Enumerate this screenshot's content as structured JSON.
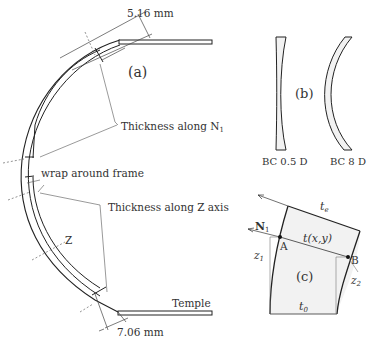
{
  "panel_a": {
    "label": "(a)",
    "dim_top": "5.16 mm",
    "dim_bottom": "7.06 mm",
    "callout_n1": "Thickness along N",
    "callout_n1_sub": "1",
    "callout_wrap": "wrap around frame",
    "callout_z": "Thickness along Z axis",
    "axis_z": "Z",
    "temple": "Temple"
  },
  "panel_b": {
    "label": "(b)",
    "lens_left": "BC 0.5 D",
    "lens_right": "BC 8 D"
  },
  "panel_c": {
    "label": "(c)",
    "t_e": "t",
    "t_e_sub": "e",
    "t_xy": "t(x,y)",
    "t_0": "t",
    "t_0_sub": "0",
    "n1": "N",
    "n1_sub": "1",
    "point_a": "A",
    "point_b": "B",
    "z1": "z",
    "z1_sub": "1",
    "z2": "z",
    "z2_sub": "2"
  },
  "colors": {
    "line": "#222222",
    "thin_line": "#555555",
    "fill": "#f2f2f2",
    "text": "#333333"
  }
}
